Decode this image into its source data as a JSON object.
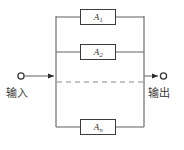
{
  "figure": {
    "type": "parallel-reliability-block-diagram",
    "background_color": "#ffffff",
    "line_color": "#6e6e6e",
    "box_border_color": "#3c3c3c",
    "text_color": "#2e2e2e",
    "width": 184,
    "height": 150
  },
  "terminals": {
    "input": {
      "label": "输入",
      "marker": "open-circle",
      "arrow": "arrow-right",
      "circle_x": 21,
      "circle_y": 76,
      "arrow_tip_x": 55,
      "label_x": 6,
      "label_y": 88
    },
    "output": {
      "label": "输出",
      "marker": "open-circle",
      "arrow": "arrow-right",
      "circle_x": 163,
      "circle_y": 76,
      "arrow_tip_x": 158,
      "label_x": 148,
      "label_y": 88
    }
  },
  "rails": {
    "left_x": 56,
    "right_x": 144,
    "top_y": 16,
    "bottom_y": 127
  },
  "branches": [
    {
      "name": "branch-1",
      "label_base": "A",
      "label_sub": "1",
      "y": 17,
      "box_x": 80,
      "box_y": 9,
      "box_w": 36,
      "box_h": 16
    },
    {
      "name": "branch-2",
      "label_base": "A",
      "label_sub": "2",
      "y": 52,
      "box_x": 80,
      "box_y": 44,
      "box_w": 36,
      "box_h": 16
    },
    {
      "name": "branch-n",
      "label_base": "A",
      "label_sub": "n",
      "y": 127,
      "box_x": 80,
      "box_y": 119,
      "box_w": 36,
      "box_h": 16
    }
  ],
  "continuation": {
    "name": "ellipsis-dashed-line",
    "style": "dashed",
    "y": 82,
    "x_start": 57,
    "x_end": 143,
    "dash_pattern": "5 4"
  }
}
